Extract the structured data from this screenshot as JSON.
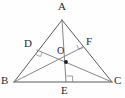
{
  "figure": {
    "kind": "geometry-diagram",
    "width": 125,
    "height": 98,
    "background_color": "#fefefe",
    "stroke_color": "#5a5a5a",
    "cevian_color": "#7a7a7a",
    "label_color": "#2b2b2b",
    "marker_color": "#1d1d1d"
  },
  "points": {
    "A": {
      "label": "A",
      "x": 62,
      "y": 20,
      "label_x": 58,
      "label_y": 2
    },
    "B": {
      "label": "B",
      "x": 14,
      "y": 82,
      "label_x": 2,
      "label_y": 76
    },
    "C": {
      "label": "C",
      "x": 112,
      "y": 82,
      "label_x": 114,
      "label_y": 76
    },
    "D": {
      "label": "D",
      "x": 37,
      "y": 50,
      "label_x": 25,
      "label_y": 38
    },
    "E": {
      "label": "E",
      "x": 66,
      "y": 82,
      "label_x": 62,
      "label_y": 85
    },
    "F": {
      "label": "F",
      "x": 83,
      "y": 47,
      "label_x": 86,
      "label_y": 36
    },
    "O": {
      "label": "O",
      "x": 66,
      "y": 62,
      "label_x": 57,
      "label_y": 44
    }
  },
  "segments": [
    {
      "name": "side-AB",
      "from": "A",
      "to": "B",
      "style": "edge"
    },
    {
      "name": "side-AC",
      "from": "A",
      "to": "C",
      "style": "edge"
    },
    {
      "name": "side-BC",
      "from": "B",
      "to": "C",
      "style": "edge"
    },
    {
      "name": "altitude-AE",
      "from": "A",
      "to": "E",
      "style": "cevian"
    },
    {
      "name": "altitude-BF",
      "from": "B",
      "to": "F",
      "style": "cevian"
    },
    {
      "name": "altitude-CD",
      "from": "C",
      "to": "D",
      "style": "cevian"
    }
  ],
  "right_angle_marks": [
    {
      "name": "right-angle-at-D",
      "vertex": "D",
      "size": 5
    },
    {
      "name": "right-angle-at-F",
      "vertex": "F",
      "size": 5
    },
    {
      "name": "right-angle-at-E",
      "vertex": "E",
      "size": 6
    }
  ],
  "markers": [
    {
      "name": "orthocenter-dot",
      "at": "O",
      "radius": 1.9,
      "filled": true
    }
  ]
}
